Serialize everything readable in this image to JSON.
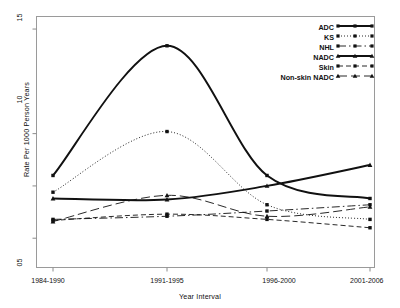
{
  "chart_data": {
    "type": "line",
    "title": "",
    "xlabel": "Year Interval",
    "ylabel": "Rate Per 1000 Person Years",
    "categories": [
      "1984-1990",
      "1991-1995",
      "1996-2000",
      "2001-2006"
    ],
    "yticks": [
      5,
      10,
      15
    ],
    "ytick_labels": [
      "05",
      "10",
      "15"
    ],
    "ylim": [
      3.6,
      15.6
    ],
    "grid": false,
    "legend_position": "top-right",
    "smoothing": "spline",
    "series": [
      {
        "name": "ADC",
        "values": [
          8.0,
          14.2,
          8.0,
          6.9
        ],
        "style": "solid",
        "marker": "square",
        "width": 1.9
      },
      {
        "name": "KS",
        "values": [
          7.2,
          10.1,
          6.6,
          5.9
        ],
        "style": "dotted",
        "marker": "square",
        "width": 0.9
      },
      {
        "name": "NHL",
        "values": [
          5.9,
          6.05,
          6.3,
          6.6
        ],
        "style": "dashdot",
        "marker": "square",
        "width": 0.9
      },
      {
        "name": "NADC",
        "values": [
          6.9,
          6.85,
          7.5,
          8.5
        ],
        "style": "solid",
        "marker": "triangle",
        "width": 1.9
      },
      {
        "name": "Skin",
        "values": [
          5.85,
          6.15,
          5.9,
          5.5
        ],
        "style": "dashed",
        "marker": "square",
        "width": 0.9
      },
      {
        "name": "Non-skin NADC",
        "values": [
          5.8,
          7.05,
          6.05,
          6.5
        ],
        "style": "longdash",
        "marker": "triangle",
        "width": 0.9
      }
    ]
  },
  "axes": {
    "y_title": "Rate Per 1000 Person Years",
    "x_title": "Year Interval",
    "ytick_labels": [
      "15",
      "10",
      "05"
    ],
    "xtick_labels": [
      "1984-1990",
      "1991-1995",
      "1996-2000",
      "2001-2006"
    ]
  },
  "legend": {
    "entries": [
      {
        "label": "ADC"
      },
      {
        "label": "KS"
      },
      {
        "label": "NHL"
      },
      {
        "label": "NADC"
      },
      {
        "label": "Skin"
      },
      {
        "label": "Non-skin NADC"
      }
    ]
  },
  "colors": {
    "line": "#111111",
    "frame": "#8c8c8c",
    "background": "#ffffff"
  }
}
